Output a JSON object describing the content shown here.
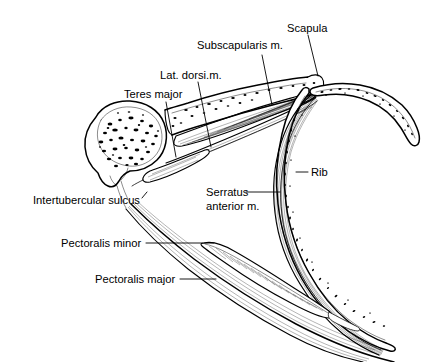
{
  "figure": {
    "background_color": "#ffffff",
    "line_color": "#000000",
    "width": 435,
    "height": 362
  },
  "labels": {
    "scapula": "Scapula",
    "subscapularis": "Subscapularis m.",
    "lat_dorsi": "Lat. dorsi.m.",
    "teres_major": "Teres major",
    "rib": "Rib",
    "serratus_line1": "Serratus",
    "serratus_line2": "anterior m.",
    "intertubercular_sulcus": "Intertubercular sulcus",
    "pectoralis_minor": "Pectoralis minor",
    "pectoralis_major": "Pectoralis major"
  },
  "structures": [
    {
      "id": "humeral-head",
      "name": "Humeral head with trabecular bone"
    },
    {
      "id": "scapula-blade",
      "name": "Scapula"
    },
    {
      "id": "subscapularis-muscle",
      "name": "Subscapularis muscle"
    },
    {
      "id": "latissimus-dorsi-tendon",
      "name": "Latissimus dorsi tendon"
    },
    {
      "id": "teres-major-tendon",
      "name": "Teres major tendon"
    },
    {
      "id": "rib-upper",
      "name": "Upper rib"
    },
    {
      "id": "rib-lower",
      "name": "Lower rib"
    },
    {
      "id": "serratus-anterior-muscle",
      "name": "Serratus anterior muscle"
    },
    {
      "id": "pectoralis-minor-muscle",
      "name": "Pectoralis minor muscle"
    },
    {
      "id": "pectoralis-major-muscle",
      "name": "Pectoralis major muscle"
    },
    {
      "id": "intertubercular-sulcus-notch",
      "name": "Intertubercular sulcus"
    }
  ]
}
